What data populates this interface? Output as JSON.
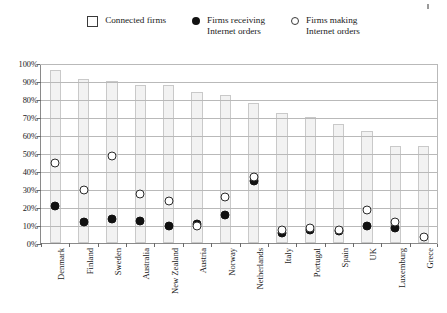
{
  "legend": {
    "items": [
      {
        "label": "Connected firms",
        "marker": "square-outline-icon"
      },
      {
        "label": "Firms receiving\nInternet orders",
        "marker": "filled-circle-icon"
      },
      {
        "label": "Firms making\nInternet orders",
        "marker": "open-circle-icon"
      }
    ]
  },
  "axis": {
    "y_ticks": [
      "100%",
      "90%",
      "80%",
      "70%",
      "60%",
      "50%",
      "40%",
      "30%",
      "20%",
      "10%",
      "0%"
    ]
  },
  "chart_data": {
    "type": "bar",
    "title": "",
    "subtitle": "",
    "xlabel": "",
    "ylabel": "",
    "ylim": [
      0,
      100
    ],
    "grid": true,
    "legend_position": "top",
    "categories": [
      "Denmark",
      "Finland",
      "Sweden",
      "Australia",
      "New Zealand",
      "Austria",
      "Norway",
      "Netherlands",
      "Italy",
      "Portugal",
      "Spain",
      "UK",
      "Luxemburg",
      "Grece"
    ],
    "series": [
      {
        "name": "Connected firms",
        "type": "bar",
        "values": [
          96,
          91,
          90,
          88,
          88,
          84,
          82,
          78,
          72,
          70,
          66,
          62,
          54,
          54
        ]
      },
      {
        "name": "Firms receiving Internet orders",
        "type": "scatter",
        "marker": "filled-circle",
        "values": [
          23,
          14,
          16,
          15,
          12,
          13,
          18,
          37,
          8,
          10,
          9,
          12,
          11,
          null
        ]
      },
      {
        "name": "Firms making Internet orders",
        "type": "scatter",
        "marker": "open-circle",
        "values": [
          47,
          32,
          51,
          30,
          26,
          12,
          28,
          39,
          10,
          11,
          10,
          21,
          14,
          6
        ]
      }
    ]
  },
  "colors": {
    "bar_fill": "#f2f2f2",
    "bar_stroke": "#c9c9c9",
    "grid": "#b9b9b9",
    "axis": "#8a8a8a",
    "filled_marker": "#111111",
    "open_marker_stroke": "#2b2b2b",
    "text": "#1a1a1a",
    "background": "#ffffff"
  }
}
